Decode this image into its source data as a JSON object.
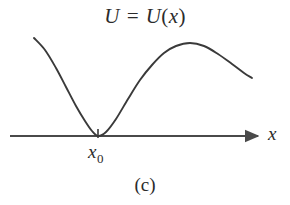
{
  "figure": {
    "title": {
      "full": "U = U(x)",
      "func_symbol": "U",
      "equals": " = ",
      "func_name": "U",
      "open_paren": "(",
      "variable": "x",
      "close_paren": ")"
    },
    "caption": "(c)",
    "axis": {
      "x_label": "x",
      "arrow": "arrow-right",
      "tick_label_main": "x",
      "tick_label_subscript": "0",
      "tick_label_full": "x0"
    },
    "colors": {
      "background": "#ffffff",
      "curve": "#3a3a3a",
      "axis": "#4a4a4a",
      "text": "#2b2b2b"
    }
  },
  "chart_data": {
    "type": "line",
    "title": "U = U(x)",
    "subtitle": "(c)",
    "xlabel": "x",
    "ylabel": "U",
    "grid": false,
    "legend": null,
    "annotations": [
      {
        "text": "x0",
        "x": 98,
        "y": 0,
        "role": "x-axis-tick-label",
        "describes": "position of potential minimum"
      },
      {
        "text": "(c)",
        "role": "figure-caption"
      },
      {
        "text": "U = U(x)",
        "role": "curve-label"
      }
    ],
    "axis_line": {
      "x_start": 10,
      "x_end": 263,
      "y_pixel": 136,
      "arrow_at_end": true
    },
    "tick_marks": [
      {
        "x_pixel": 98,
        "label": "x0",
        "length_px": 9
      }
    ],
    "xlim": [
      10,
      263
    ],
    "series": [
      {
        "name": "U(x)",
        "description": "potential energy curve: descends from upper left to a minimum touching the x axis at x0, rises to a local maximum, then descends to the right",
        "points_pixel": [
          [
            34,
            38
          ],
          [
            45,
            50
          ],
          [
            56,
            68
          ],
          [
            66,
            87
          ],
          [
            76,
            106
          ],
          [
            85,
            121
          ],
          [
            92,
            131
          ],
          [
            98,
            136
          ],
          [
            106,
            132
          ],
          [
            116,
            119
          ],
          [
            128,
            99
          ],
          [
            140,
            80
          ],
          [
            152,
            65
          ],
          [
            164,
            53
          ],
          [
            176,
            46
          ],
          [
            190,
            43
          ],
          [
            204,
            46
          ],
          [
            218,
            54
          ],
          [
            232,
            64
          ],
          [
            244,
            73
          ],
          [
            252,
            78
          ]
        ],
        "key_features": {
          "minimum": {
            "x_pixel": 98,
            "y_pixel": 136,
            "label": "x0",
            "touches_axis": true
          },
          "maximum": {
            "x_pixel": 190,
            "y_pixel": 43
          },
          "left_endpoint": {
            "x_pixel": 34,
            "y_pixel": 38
          },
          "right_endpoint": {
            "x_pixel": 252,
            "y_pixel": 78
          }
        }
      }
    ]
  }
}
